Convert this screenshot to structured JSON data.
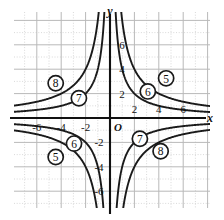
{
  "figure": {
    "kind": "coordinate-graph",
    "axis_x_label": "x",
    "axis_y_label": "y",
    "origin_label": "O"
  },
  "ticks": {
    "x_positive": [
      "2",
      "4",
      "6"
    ],
    "x_negative": [
      "-2",
      "-4",
      "-6"
    ],
    "y_positive": [
      "2",
      "4",
      "6"
    ],
    "y_negative": [
      "-2",
      "-4",
      "-6"
    ]
  },
  "callouts": [
    {
      "id": "c8-ul",
      "label": "8",
      "quadrant": "II"
    },
    {
      "id": "c7-ul",
      "label": "7",
      "quadrant": "II"
    },
    {
      "id": "c5-ur",
      "label": "5",
      "quadrant": "I"
    },
    {
      "id": "c6-ur",
      "label": "6",
      "quadrant": "I"
    },
    {
      "id": "c6-ll",
      "label": "6",
      "quadrant": "III"
    },
    {
      "id": "c5-ll",
      "label": "5",
      "quadrant": "III"
    },
    {
      "id": "c7-lr",
      "label": "7",
      "quadrant": "IV"
    },
    {
      "id": "c8-lr",
      "label": "8",
      "quadrant": "IV"
    }
  ],
  "chart_data": {
    "type": "line",
    "title": "",
    "xlabel": "x",
    "ylabel": "y",
    "xlim": [
      -8,
      8
    ],
    "ylim": [
      -8,
      8
    ],
    "xticks": [
      -6,
      -4,
      -2,
      2,
      4,
      6
    ],
    "yticks": [
      -6,
      -4,
      -2,
      2,
      4,
      6
    ],
    "grid": "major every 2 units (solid), minor every 1 unit (dotted)",
    "legend": "none (curves annotated with circled numbers 5-8)",
    "series": [
      {
        "name": "5",
        "equation": "y = 8/x",
        "k": 8,
        "branches": "quadrants I and III",
        "annotation": "circled 5"
      },
      {
        "name": "6",
        "equation": "y = 4/x",
        "k": 4,
        "branches": "quadrants I and III",
        "annotation": "circled 6"
      },
      {
        "name": "7",
        "equation": "y = -4/x",
        "k": -4,
        "branches": "quadrants II and IV",
        "annotation": "circled 7"
      },
      {
        "name": "8",
        "equation": "y = -8/x",
        "k": -8,
        "branches": "quadrants II and IV",
        "annotation": "circled 8"
      }
    ]
  },
  "colors": {
    "curve": "#1a1a1a",
    "axis": "#111111",
    "grid_major": "#b9b9b9",
    "grid_minor": "#cfcfcf",
    "text": "#111111"
  }
}
